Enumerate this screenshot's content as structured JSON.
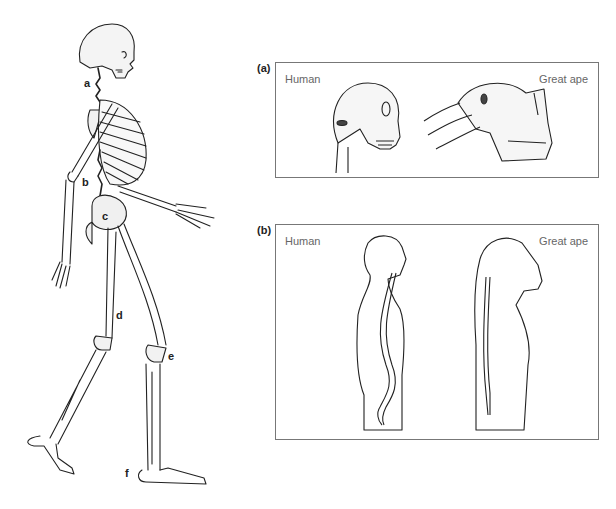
{
  "figure": {
    "skeleton": {
      "description": "Human skeleton walking in side view",
      "labels": [
        {
          "id": "a",
          "text": "a",
          "target": "neck/cervical spine"
        },
        {
          "id": "b",
          "text": "b",
          "target": "lumbar spine"
        },
        {
          "id": "c",
          "text": "c",
          "target": "pelvis"
        },
        {
          "id": "d",
          "text": "d",
          "target": "femur"
        },
        {
          "id": "e",
          "text": "e",
          "target": "knee"
        },
        {
          "id": "f",
          "text": "f",
          "target": "foot"
        }
      ]
    },
    "panels": [
      {
        "tag": "(a)",
        "left_caption": "Human",
        "right_caption": "Great ape",
        "content": "Skull comparison showing foramen magnum position"
      },
      {
        "tag": "(b)",
        "left_caption": "Human",
        "right_caption": "Great ape",
        "content": "Body silhouettes comparing spinal curvature"
      }
    ]
  }
}
